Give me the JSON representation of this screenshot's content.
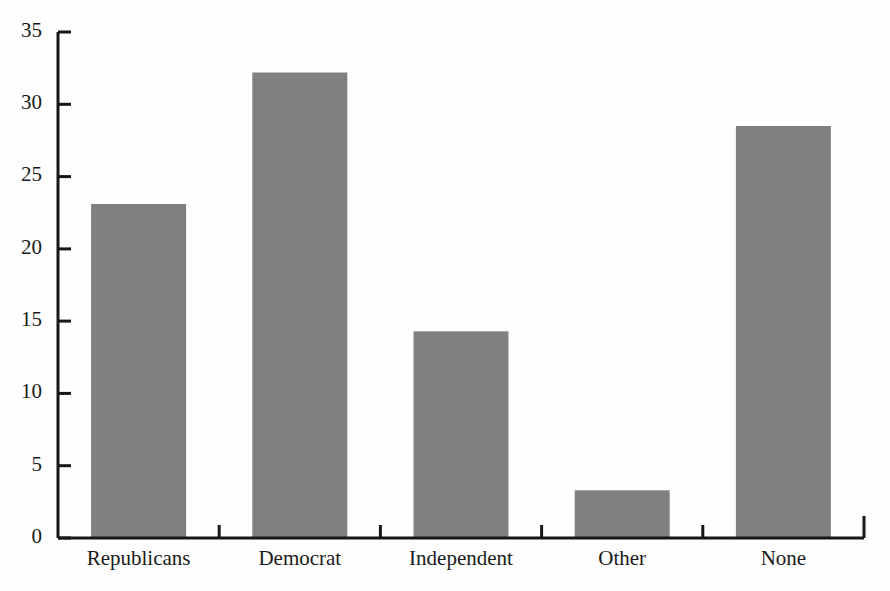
{
  "chart_data": {
    "type": "bar",
    "title": "",
    "subtitle": "",
    "xlabel": "",
    "ylabel": "",
    "categories": [
      "Republicans",
      "Democrat",
      "Independent",
      "Other",
      "None"
    ],
    "values": [
      23.1,
      32.2,
      14.3,
      3.3,
      28.5
    ],
    "series": [
      {
        "name": "",
        "values": [
          23.1,
          32.2,
          14.3,
          3.3,
          28.5
        ]
      }
    ],
    "ylim": [
      0,
      35
    ],
    "ytick_labels": [
      "0",
      "5",
      "10",
      "15",
      "20",
      "25",
      "30",
      "35"
    ],
    "ytick_values": [
      0,
      5,
      10,
      15,
      20,
      25,
      30,
      35
    ],
    "grid": false,
    "legend": false,
    "legend_position": "none",
    "bar_color": "#808080",
    "axis_color": "#171717",
    "background_color": "#fefefe",
    "annotations": []
  },
  "axes": {
    "y_axis_name": "y-axis",
    "x_axis_name": "x-axis"
  }
}
